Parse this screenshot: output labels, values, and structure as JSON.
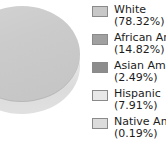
{
  "chart_data": {
    "type": "pie",
    "title": "",
    "xlabel": "",
    "ylabel": "",
    "legend_position": "right",
    "grid": false,
    "three_d": true,
    "categories": [
      "White",
      "African Am",
      "Asian Am",
      "Hispanic",
      "Native Am"
    ],
    "values": [
      78.32,
      14.82,
      2.49,
      7.91,
      0.19
    ],
    "value_labels": [
      "(78.32%)",
      "(14.82%)",
      "(2.49%)",
      "(7.91%)",
      "(0.19%)"
    ],
    "colors": [
      "#c8c8c8",
      "#a0a0a0",
      "#8c8c8c",
      "#e8e8e8",
      "#dcdcdc"
    ],
    "series": [
      {
        "name": "Population share",
        "values": [
          78.32,
          14.82,
          2.49,
          7.91,
          0.19
        ]
      }
    ]
  },
  "legend": {
    "items": [
      {
        "label": "White",
        "value": "(78.32%)",
        "color": "#c8c8c8"
      },
      {
        "label": "African Am",
        "value": "(14.82%)",
        "color": "#a0a0a0"
      },
      {
        "label": "Asian Am",
        "value": "(2.49%)",
        "color": "#8c8c8c"
      },
      {
        "label": "Hispanic",
        "value": "(7.91%)",
        "color": "#e8e8e8"
      },
      {
        "label": "Native Am",
        "value": "(0.19%)",
        "color": "#dcdcdc"
      }
    ]
  },
  "canvas": {
    "background": "#ffffff"
  }
}
